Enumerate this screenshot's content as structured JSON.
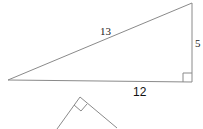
{
  "diagram": {
    "type": "right-triangle",
    "labels": {
      "hypotenuse": "13",
      "vertical_leg": "5",
      "horizontal_leg": "12"
    },
    "colors": {
      "stroke": "#8a8a8a",
      "text": "#222222",
      "background": "#ffffff"
    }
  },
  "second_figure": {
    "type": "partial-right-angle-triangle",
    "note": "rotated right angle apex"
  }
}
